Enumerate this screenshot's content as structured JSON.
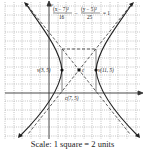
{
  "diagram": {
    "title_equation": {
      "numerator_1": "(x − 7)²",
      "denominator_1": "16",
      "minus": "−",
      "numerator_2": "(y − 5)²",
      "denominator_2": "25",
      "equals": "= 1"
    },
    "points": [
      {
        "label": "v(3, 5)",
        "x": 3,
        "y": 5,
        "type": "vertex"
      },
      {
        "label": "v(11, 5)",
        "x": 11,
        "y": 5,
        "type": "vertex"
      },
      {
        "label": "c(7, 5)",
        "x": 7,
        "y": 5,
        "type": "center"
      }
    ],
    "center_marker": "c",
    "axes": {
      "x_label": "x",
      "y_label": "y"
    },
    "scale_caption": "Scale: 1 square = 2 units",
    "colors": {
      "curve": "#222222",
      "grid": "#9a9a9a",
      "asymptote": "#333333"
    }
  }
}
